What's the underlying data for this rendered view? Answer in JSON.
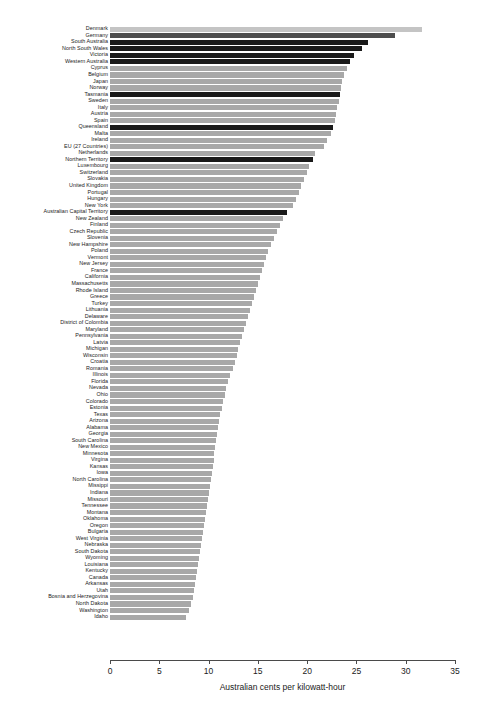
{
  "chart_data": {
    "type": "bar",
    "orientation": "horizontal",
    "title": "",
    "xlabel": "Australian cents per kilowatt-hour",
    "ylabel": "",
    "xlim": [
      0,
      35
    ],
    "xticks": [
      0,
      5,
      10,
      15,
      20,
      25,
      30,
      35
    ],
    "grid": false,
    "legend": "none",
    "colors": {
      "default_bar": "#a8a8a8",
      "highlight_bar": "#1a1a1a",
      "mid_bar": "#4d4d4d",
      "top_bar": "#c4c4c4",
      "axis": "#4a4a4a",
      "text": "#1b1b1b"
    },
    "categories": [
      "Denmark",
      "Germany",
      "South Australia",
      "North South Wales",
      "Victoria",
      "Western Australia",
      "Cyprus",
      "Belgium",
      "Japan",
      "Norway",
      "Tasmania",
      "Sweden",
      "Italy",
      "Austria",
      "Spain",
      "Queensland",
      "Malta",
      "Ireland",
      "EU (27 Countries)",
      "Netherlands",
      "Northern Territory",
      "Luxembourg",
      "Switzerland",
      "Slovakia",
      "United Kingdom",
      "Portugal",
      "Hungary",
      "New York",
      "Australian Capital Territory",
      "New Zealand",
      "Finland",
      "Czech Republic",
      "Slovenia",
      "New Hampshire",
      "Poland",
      "Vermont",
      "New Jersey",
      "France",
      "California",
      "Massachusetts",
      "Rhode Island",
      "Greece",
      "Turkey",
      "Lithuania",
      "Delaware",
      "District of Colombia",
      "Maryland",
      "Pennsylvania",
      "Latvia",
      "Michigan",
      "Wisconsin",
      "Croatia",
      "Romania",
      "Illinois",
      "Florida",
      "Nevada",
      "Ohio",
      "Colorado",
      "Estonia",
      "Texas",
      "Arizona",
      "Alabama",
      "Georgia",
      "South Carolina",
      "New Mexico",
      "Minnesota",
      "Virgina",
      "Kansas",
      "Iowa",
      "North Carolina",
      "Missippi",
      "Indiana",
      "Missouri",
      "Tennessee",
      "Montana",
      "Oklahoma",
      "Oregon",
      "Bulgaria",
      "West Virginia",
      "Nebraska",
      "South Dakota",
      "Wyoming",
      "Louisiana",
      "Kentucky",
      "Canada",
      "Arkansas",
      "Utah",
      "Bosnia and Herzegovina",
      "North Dakota",
      "Washington",
      "Idaho"
    ],
    "values": [
      31.7,
      28.9,
      26.2,
      25.6,
      24.8,
      24.3,
      24.0,
      23.7,
      23.5,
      23.4,
      23.3,
      23.2,
      23.0,
      22.9,
      22.8,
      22.6,
      22.4,
      22.0,
      21.7,
      20.8,
      20.6,
      20.2,
      20.0,
      19.7,
      19.4,
      19.2,
      18.9,
      18.6,
      18.0,
      17.5,
      17.2,
      16.9,
      16.6,
      16.3,
      16.0,
      15.8,
      15.6,
      15.4,
      15.2,
      15.0,
      14.8,
      14.6,
      14.4,
      14.2,
      14.0,
      13.8,
      13.6,
      13.4,
      13.2,
      13.0,
      12.9,
      12.7,
      12.5,
      12.2,
      12.0,
      11.8,
      11.7,
      11.5,
      11.4,
      11.2,
      11.1,
      11.0,
      10.9,
      10.8,
      10.7,
      10.6,
      10.5,
      10.4,
      10.3,
      10.2,
      10.1,
      10.0,
      9.9,
      9.8,
      9.7,
      9.6,
      9.5,
      9.4,
      9.3,
      9.2,
      9.1,
      9.0,
      8.9,
      8.8,
      8.7,
      8.6,
      8.5,
      8.4,
      8.2,
      8.0,
      7.7
    ],
    "highlighted": [
      "South Australia",
      "North South Wales",
      "Victoria",
      "Western Australia",
      "Tasmania",
      "Queensland",
      "Northern Territory",
      "Australian Capital Territory"
    ]
  }
}
